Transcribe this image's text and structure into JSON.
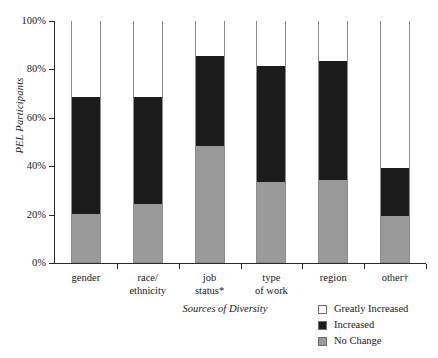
{
  "chart_data": {
    "type": "bar",
    "subtype": "stacked-percent",
    "title": "",
    "xlabel": "Sources of Diversity",
    "ylabel": "PEL Participants",
    "categories": [
      "gender",
      "race/\nethnicity",
      "job\nstatus*",
      "type\nof work",
      "region",
      "other†"
    ],
    "series": [
      {
        "name": "No Change",
        "color": "#9a9a9a",
        "values": [
          20,
          24,
          48,
          33,
          34,
          19
        ]
      },
      {
        "name": "Increased",
        "color": "#1c1c1c",
        "values": [
          48,
          44,
          37,
          48,
          49,
          20
        ]
      },
      {
        "name": "Greatly Increased",
        "color": "#ffffff",
        "values": [
          32,
          32,
          15,
          19,
          17,
          61
        ]
      }
    ],
    "ylim": [
      0,
      100
    ],
    "yticks": [
      0,
      20,
      40,
      60,
      80,
      100
    ],
    "ytick_labels": [
      "0%",
      "20%",
      "40%",
      "60%",
      "80%",
      "100%"
    ],
    "grid": false,
    "legend_position": "bottom-right",
    "stack_order_bottom_to_top": [
      "No Change",
      "Increased",
      "Greatly Increased"
    ]
  },
  "legend": {
    "items": [
      {
        "label": "Greatly Increased",
        "swatch": "greatly"
      },
      {
        "label": "Increased",
        "swatch": "increased"
      },
      {
        "label": "No Change",
        "swatch": "nochange"
      }
    ]
  }
}
